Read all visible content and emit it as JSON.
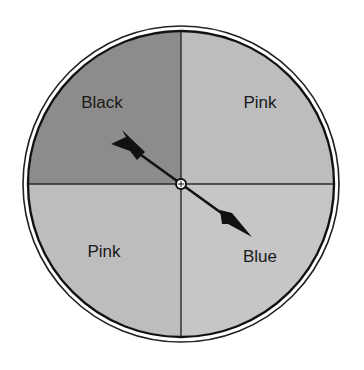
{
  "spinner": {
    "sections": [
      {
        "position": "top-left",
        "label": "Black",
        "color": "#8c8c8c"
      },
      {
        "position": "top-right",
        "label": "Pink",
        "color": "#bdbdbd"
      },
      {
        "position": "bottom-left",
        "label": "Pink",
        "color": "#bdbdbd"
      },
      {
        "position": "bottom-right",
        "label": "Blue",
        "color": "#c6c6c6"
      }
    ],
    "arrow": {
      "points_to": "Blue"
    }
  }
}
